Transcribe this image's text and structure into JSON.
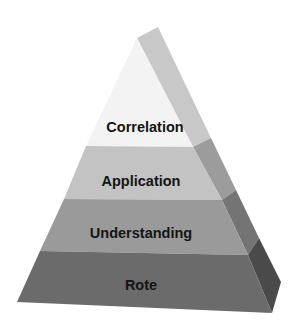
{
  "diagram": {
    "type": "pyramid",
    "levels": [
      {
        "label": "Correlation",
        "order": 1,
        "front_color": "#f2f2f2",
        "side_color": "#c9c9c9"
      },
      {
        "label": "Application",
        "order": 2,
        "front_color": "#c4c4c4",
        "side_color": "#9a9a9a"
      },
      {
        "label": "Understanding",
        "order": 3,
        "front_color": "#999999",
        "side_color": "#707070"
      },
      {
        "label": "Rote",
        "order": 4,
        "front_color": "#6a6a6a",
        "side_color": "#4a4a4a"
      }
    ]
  }
}
